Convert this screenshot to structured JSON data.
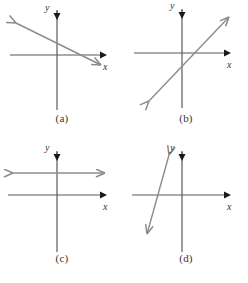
{
  "figure": {
    "type": "multi-panel-coordinate-graphs",
    "panel_count": 4,
    "background_color": "#ffffff",
    "axis_color": "#595959",
    "axis_arrow_color": "#1a1a1a",
    "line_color": "#8c8c8c",
    "caption_color": "#333333",
    "label_color": "#333333"
  },
  "panels": [
    {
      "id": "panel-a",
      "caption": "(a)",
      "x_axis_label": "x",
      "y_axis_label": "y",
      "origin": {
        "x": 57,
        "y": 55
      },
      "x_axis": {
        "x1": 10,
        "y1": 55,
        "x2": 104,
        "y2": 55
      },
      "y_axis": {
        "x1": 57,
        "y1": 8,
        "x2": 57,
        "y2": 110
      },
      "x_label_pos": {
        "x": 104,
        "y": 70
      },
      "y_label_pos": {
        "x": 47,
        "y": 11
      },
      "line": {
        "x1": 13,
        "y1": 22,
        "x2": 104,
        "y2": 67,
        "slope_sign": "negative",
        "description": "line with small negative slope crossing y-axis above origin and x-axis right of origin",
        "arrows": "both"
      }
    },
    {
      "id": "panel-b",
      "caption": "(b)",
      "x_axis_label": "x",
      "y_axis_label": "y",
      "origin": {
        "x": 58,
        "y": 53
      },
      "x_axis": {
        "x1": 10,
        "y1": 53,
        "x2": 104,
        "y2": 53
      },
      "y_axis": {
        "x1": 58,
        "y1": 6,
        "x2": 58,
        "y2": 108
      },
      "x_label_pos": {
        "x": 104,
        "y": 68
      },
      "y_label_pos": {
        "x": 48,
        "y": 9
      },
      "line": {
        "x1": 22,
        "y1": 104,
        "x2": 108,
        "y2": 14,
        "slope_sign": "positive",
        "description": "line with positive slope crossing x-axis right of origin and y-axis below origin",
        "arrows": "both"
      }
    },
    {
      "id": "panel-c",
      "caption": "(c)",
      "x_axis_label": "x",
      "y_axis_label": "y",
      "origin": {
        "x": 57,
        "y": 53
      },
      "x_axis": {
        "x1": 8,
        "y1": 53,
        "x2": 104,
        "y2": 53
      },
      "y_axis": {
        "x1": 57,
        "y1": 6,
        "x2": 57,
        "y2": 110
      },
      "x_label_pos": {
        "x": 104,
        "y": 68
      },
      "y_label_pos": {
        "x": 47,
        "y": 9
      },
      "line": {
        "x1": 10,
        "y1": 31,
        "x2": 108,
        "y2": 31,
        "slope_sign": "zero",
        "description": "horizontal line above the x-axis (zero slope)",
        "arrows": "both"
      }
    },
    {
      "id": "panel-d",
      "caption": "(d)",
      "x_axis_label": "x",
      "y_axis_label": "y",
      "origin": {
        "x": 58,
        "y": 53
      },
      "x_axis": {
        "x1": 8,
        "y1": 53,
        "x2": 104,
        "y2": 53
      },
      "y_axis": {
        "x1": 58,
        "y1": 6,
        "x2": 58,
        "y2": 110
      },
      "x_label_pos": {
        "x": 104,
        "y": 68
      },
      "y_label_pos": {
        "x": 48,
        "y": 9
      },
      "line": {
        "x1": 44,
        "y1": 10,
        "x2": 21,
        "y2": 95,
        "slope_sign": "steep-negative",
        "description": "steeply negative sloped line left of the y-axis crossing x-axis left of origin",
        "arrows": "both"
      }
    }
  ],
  "panel_positions": [
    {
      "left": 0,
      "top": 0
    },
    {
      "left": 124,
      "top": 0
    },
    {
      "left": 0,
      "top": 142
    },
    {
      "left": 124,
      "top": 142
    }
  ],
  "caption_tops": [
    112,
    112,
    110,
    110
  ]
}
